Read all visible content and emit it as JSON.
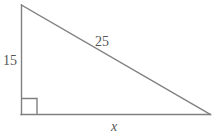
{
  "figure": {
    "type": "right-triangle-diagram",
    "background_color": "#ffffff",
    "stroke_color": "#808080",
    "label_color": "#555555",
    "width": 218,
    "height": 135,
    "vertices": {
      "apex": [
        21,
        5
      ],
      "right_angle": [
        21,
        114
      ],
      "base_right": [
        210,
        114
      ]
    },
    "right_angle_marker": {
      "x": 21,
      "y": 98,
      "size": 16
    },
    "labels": {
      "vertical_leg": "15",
      "hypotenuse": "25",
      "base": "x"
    }
  }
}
